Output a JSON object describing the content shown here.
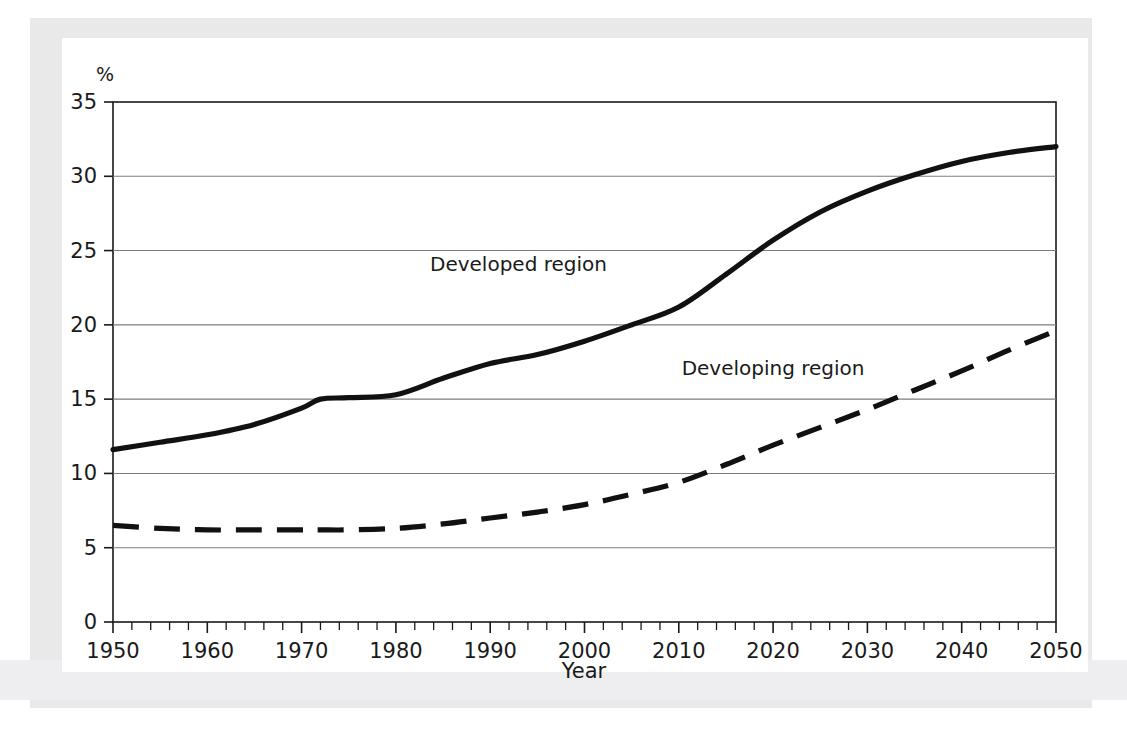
{
  "figure": {
    "percent_symbol": "%",
    "background_color": "#ffffff",
    "page_tint_color": "#e9e9ea",
    "axis_color": "#1a1a1a",
    "grid_color": "#7c7c7c",
    "series_color": "#111111"
  },
  "chart_data": {
    "type": "line",
    "title": "",
    "subtitle": "",
    "xlabel": "Year",
    "ylabel": "%",
    "xlim": [
      1950,
      2050
    ],
    "ylim": [
      0,
      35
    ],
    "xticks": [
      1950,
      1960,
      1970,
      1980,
      1990,
      2000,
      2010,
      2020,
      2030,
      2040,
      2050
    ],
    "xtick_labels": [
      "1950",
      "1960",
      "1970",
      "1980",
      "1990",
      "2000",
      "2010",
      "2020",
      "2030",
      "2040",
      "2050"
    ],
    "x_minor_tick_step": 2,
    "yticks": [
      0,
      5,
      10,
      15,
      20,
      25,
      30,
      35
    ],
    "ytick_labels": [
      "0",
      "5",
      "10",
      "15",
      "20",
      "25",
      "30",
      "35"
    ],
    "grid": "horizontal",
    "legend_position": "inline-annotation",
    "x": [
      1950,
      1955,
      1960,
      1965,
      1970,
      1972,
      1975,
      1980,
      1985,
      1990,
      1995,
      2000,
      2005,
      2010,
      2015,
      2020,
      2025,
      2030,
      2035,
      2040,
      2045,
      2050
    ],
    "series": [
      {
        "name": "Developed region",
        "style": "solid",
        "label_x": 1993,
        "label_y": 23.6,
        "values": [
          11.6,
          12.1,
          12.6,
          13.3,
          14.4,
          15.0,
          15.1,
          15.3,
          16.4,
          17.4,
          18.0,
          18.9,
          20.0,
          21.2,
          23.4,
          25.7,
          27.6,
          29.0,
          30.1,
          31.0,
          31.6,
          32.0
        ]
      },
      {
        "name": "Developing region",
        "style": "dashed",
        "label_x": 2020,
        "label_y": 16.6,
        "values": [
          6.5,
          6.3,
          6.2,
          6.2,
          6.2,
          6.2,
          6.2,
          6.3,
          6.6,
          7.0,
          7.4,
          7.9,
          8.6,
          9.4,
          10.6,
          11.9,
          13.1,
          14.3,
          15.6,
          16.9,
          18.3,
          19.6
        ]
      }
    ]
  }
}
